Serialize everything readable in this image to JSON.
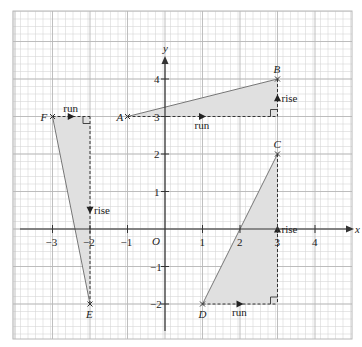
{
  "axes": {
    "x_label": "x",
    "y_label": "y",
    "origin_label": "O",
    "x_ticks": [
      "−3",
      "−2",
      "−1",
      "1",
      "2",
      "3",
      "4"
    ],
    "x_tick_values": [
      -3,
      -2,
      -1,
      1,
      2,
      3,
      4
    ],
    "y_ticks": [
      "4",
      "3",
      "2",
      "1",
      "−1",
      "−2"
    ],
    "y_tick_values": [
      4,
      3,
      2,
      1,
      -1,
      -2
    ],
    "xlim": [
      -3.4,
      5.05
    ],
    "ylim": [
      -2.95,
      5.8
    ],
    "grid_minor_step": 0.2
  },
  "points": [
    {
      "label": "A",
      "x": -1,
      "y": 3
    },
    {
      "label": "B",
      "x": 3,
      "y": 4
    },
    {
      "label": "C",
      "x": 3,
      "y": 2
    },
    {
      "label": "D",
      "x": 1,
      "y": -2
    },
    {
      "label": "E",
      "x": -2,
      "y": -2
    },
    {
      "label": "F",
      "x": -3,
      "y": 3
    }
  ],
  "triangles": [
    {
      "name": "AB",
      "from": "A",
      "to": "B",
      "corner": [
        3,
        3
      ],
      "run_label": "run",
      "rise_label": "rise"
    },
    {
      "name": "DC",
      "from": "D",
      "to": "C",
      "corner": [
        3,
        -2
      ],
      "run_label": "run",
      "rise_label": "rise"
    },
    {
      "name": "FE",
      "from": "F",
      "to": "E",
      "corner": [
        -2,
        3
      ],
      "run_label": "run",
      "rise_label": "rise"
    }
  ],
  "colors": {
    "fill": "#e0e0e0",
    "grid_major": "#b8b8b8",
    "grid_minor": "#d6d6d6",
    "axis": "#333333"
  }
}
